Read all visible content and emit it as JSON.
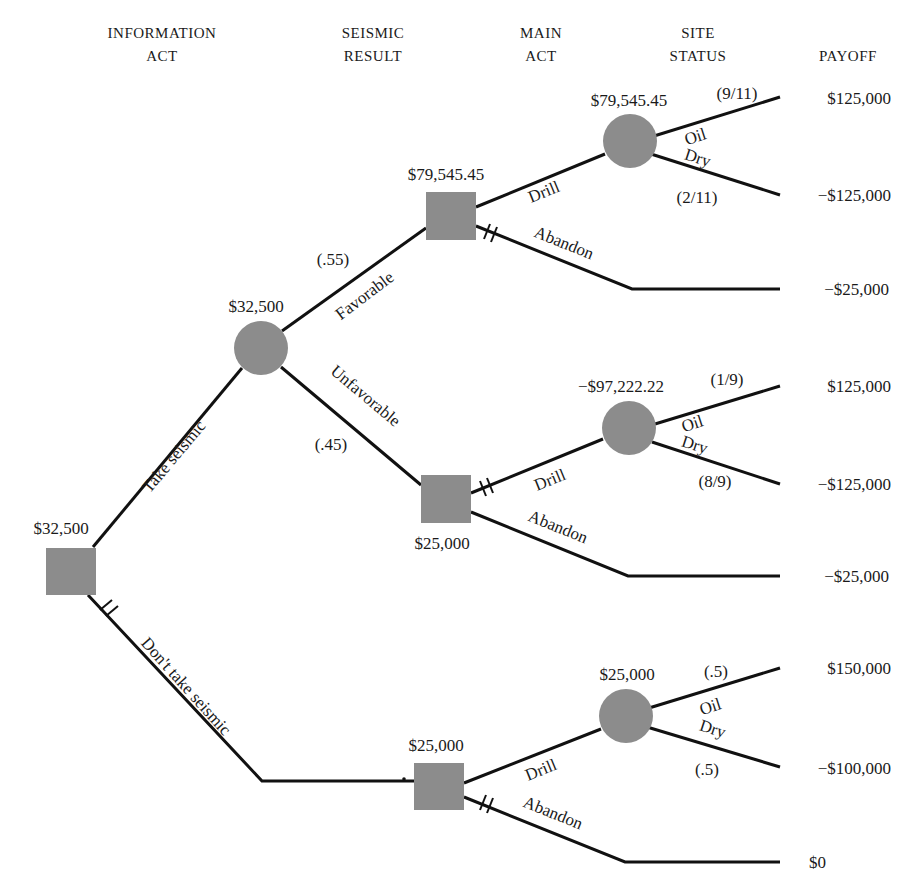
{
  "headers": {
    "information_act": [
      "INFORMATION",
      "ACT"
    ],
    "seismic_result": [
      "SEISMIC",
      "RESULT"
    ],
    "main_act": [
      "MAIN",
      "ACT"
    ],
    "site_status": [
      "SITE",
      "STATUS"
    ],
    "payoff": [
      "PAYOFF"
    ]
  },
  "colors": {
    "node_fill": "#8c8c8c",
    "line": "#111111",
    "background": "#ffffff"
  },
  "root": {
    "type": "decision",
    "value": "$32,500",
    "branches": {
      "take_seismic": {
        "label": "Take seismic"
      },
      "dont_take_seismic": {
        "label": "Don't take seismic",
        "pruned": true
      }
    }
  },
  "seismic_chance": {
    "type": "chance",
    "value": "$32,500",
    "favorable": {
      "label": "Favorable",
      "prob": "(.55)"
    },
    "unfavorable": {
      "label": "Unfavorable",
      "prob": "(.45)"
    }
  },
  "favorable_decision": {
    "type": "decision",
    "value": "$79,545.45",
    "drill_label": "Drill",
    "abandon_label": "Abandon",
    "abandon_pruned": true,
    "chance": {
      "value": "$79,545.45",
      "oil": {
        "label": "Oil",
        "prob": "(9/11)",
        "payoff": "$125,000"
      },
      "dry": {
        "label": "Dry",
        "prob": "(2/11)",
        "payoff": "−$125,000"
      }
    },
    "abandon_payoff": "−$25,000"
  },
  "unfavorable_decision": {
    "type": "decision",
    "value": "$25,000",
    "drill_label": "Drill",
    "drill_pruned": true,
    "abandon_label": "Abandon",
    "chance": {
      "value": "−$97,222.22",
      "oil": {
        "label": "Oil",
        "prob": "(1/9)",
        "payoff": "$125,000"
      },
      "dry": {
        "label": "Dry",
        "prob": "(8/9)",
        "payoff": "−$125,000"
      }
    },
    "abandon_payoff": "−$25,000"
  },
  "no_seismic_decision": {
    "type": "decision",
    "value": "$25,000",
    "drill_label": "Drill",
    "abandon_label": "Abandon",
    "abandon_pruned": true,
    "chance": {
      "value": "$25,000",
      "oil": {
        "label": "Oil",
        "prob": "(.5)",
        "payoff": "$150,000"
      },
      "dry": {
        "label": "Dry",
        "prob": "(.5)",
        "payoff": "−$100,000"
      }
    },
    "abandon_payoff": "$0"
  }
}
